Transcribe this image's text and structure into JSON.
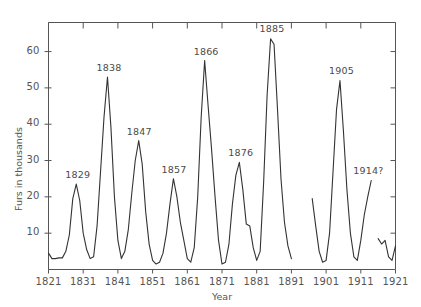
{
  "chart_data": {
    "type": "line",
    "title": "",
    "xlabel": "Year",
    "ylabel": "Furs in thousands",
    "xlim": [
      1821,
      1921
    ],
    "ylim": [
      0,
      68
    ],
    "grid": false,
    "legend": null,
    "x_ticks": [
      "1821",
      "1831",
      "1841",
      "1851",
      "1861",
      "1871",
      "1881",
      "1891",
      "1901",
      "1911",
      "1921"
    ],
    "x_tick_values": [
      1821,
      1831,
      1841,
      1851,
      1861,
      1871,
      1881,
      1891,
      1901,
      1911,
      1921
    ],
    "y_ticks": [
      "10",
      "20",
      "30",
      "40",
      "50",
      "60"
    ],
    "y_tick_values": [
      10,
      20,
      30,
      40,
      50,
      60
    ],
    "line_color": "#333333",
    "axis_color": "#555555",
    "annotations": [
      {
        "label": "1829",
        "x": 1829,
        "y": 23.5
      },
      {
        "label": "1838",
        "x": 1838,
        "y": 53.0
      },
      {
        "label": "1847",
        "x": 1847,
        "y": 35.5
      },
      {
        "label": "1857",
        "x": 1857,
        "y": 25.0
      },
      {
        "label": "1866",
        "x": 1866,
        "y": 57.5
      },
      {
        "label": "1876",
        "x": 1876,
        "y": 29.5
      },
      {
        "label": "1885",
        "x": 1885,
        "y": 63.5
      },
      {
        "label": "1905",
        "x": 1905,
        "y": 52.0
      },
      {
        "label": "1914?",
        "x": 1914,
        "y": 24.5
      }
    ],
    "segments": [
      {
        "name": "1821-1891",
        "points": [
          [
            1821,
            4.5
          ],
          [
            1822,
            3.0
          ],
          [
            1823,
            3.0
          ],
          [
            1824,
            3.2
          ],
          [
            1825,
            3.2
          ],
          [
            1826,
            5.0
          ],
          [
            1827,
            9.5
          ],
          [
            1828,
            19.5
          ],
          [
            1829,
            23.5
          ],
          [
            1830,
            19.0
          ],
          [
            1831,
            10.0
          ],
          [
            1832,
            5.5
          ],
          [
            1833,
            3.0
          ],
          [
            1834,
            3.5
          ],
          [
            1835,
            12.0
          ],
          [
            1836,
            27.0
          ],
          [
            1837,
            42.0
          ],
          [
            1838,
            53.0
          ],
          [
            1839,
            39.0
          ],
          [
            1840,
            20.0
          ],
          [
            1841,
            8.0
          ],
          [
            1842,
            3.0
          ],
          [
            1843,
            5.0
          ],
          [
            1844,
            11.0
          ],
          [
            1845,
            21.0
          ],
          [
            1846,
            30.0
          ],
          [
            1847,
            35.5
          ],
          [
            1848,
            29.0
          ],
          [
            1849,
            16.0
          ],
          [
            1850,
            7.0
          ],
          [
            1851,
            2.5
          ],
          [
            1852,
            1.5
          ],
          [
            1853,
            2.0
          ],
          [
            1854,
            4.5
          ],
          [
            1855,
            10.0
          ],
          [
            1856,
            18.0
          ],
          [
            1857,
            25.0
          ],
          [
            1858,
            20.0
          ],
          [
            1859,
            13.0
          ],
          [
            1860,
            8.0
          ],
          [
            1861,
            3.0
          ],
          [
            1862,
            2.0
          ],
          [
            1863,
            6.0
          ],
          [
            1864,
            20.0
          ],
          [
            1865,
            42.0
          ],
          [
            1866,
            57.5
          ],
          [
            1867,
            45.0
          ],
          [
            1868,
            33.0
          ],
          [
            1869,
            20.0
          ],
          [
            1870,
            8.0
          ],
          [
            1871,
            1.5
          ],
          [
            1872,
            2.0
          ],
          [
            1873,
            7.0
          ],
          [
            1874,
            18.0
          ],
          [
            1875,
            26.0
          ],
          [
            1876,
            29.5
          ],
          [
            1877,
            22.0
          ],
          [
            1878,
            12.5
          ],
          [
            1879,
            12.0
          ],
          [
            1880,
            6.0
          ],
          [
            1881,
            2.5
          ],
          [
            1882,
            5.0
          ],
          [
            1883,
            24.0
          ],
          [
            1884,
            48.0
          ],
          [
            1885,
            63.5
          ],
          [
            1886,
            62.0
          ],
          [
            1887,
            44.0
          ],
          [
            1888,
            25.0
          ],
          [
            1889,
            13.0
          ],
          [
            1890,
            6.5
          ],
          [
            1891,
            3.0
          ]
        ]
      },
      {
        "name": "1897-1914",
        "points": [
          [
            1897,
            19.5
          ],
          [
            1898,
            12.0
          ],
          [
            1899,
            5.0
          ],
          [
            1900,
            2.0
          ],
          [
            1901,
            2.5
          ],
          [
            1902,
            10.0
          ],
          [
            1903,
            27.0
          ],
          [
            1904,
            44.0
          ],
          [
            1905,
            52.0
          ],
          [
            1906,
            38.0
          ],
          [
            1907,
            22.0
          ],
          [
            1908,
            10.0
          ],
          [
            1909,
            3.5
          ],
          [
            1910,
            2.5
          ],
          [
            1911,
            8.0
          ],
          [
            1912,
            15.0
          ],
          [
            1913,
            20.0
          ],
          [
            1914,
            24.5
          ]
        ]
      },
      {
        "name": "1916-1921",
        "points": [
          [
            1916,
            8.5
          ],
          [
            1917,
            7.0
          ],
          [
            1918,
            8.0
          ],
          [
            1919,
            3.5
          ],
          [
            1920,
            2.5
          ],
          [
            1921,
            6.5
          ]
        ]
      }
    ]
  }
}
